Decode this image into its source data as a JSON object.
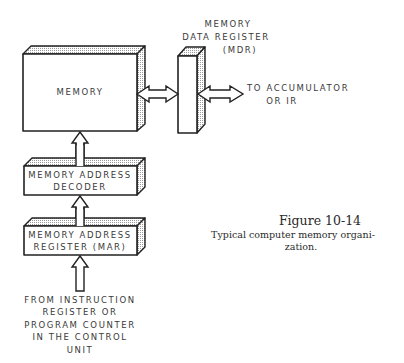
{
  "diagram": {
    "blocks": {
      "memory": {
        "label": "MEMORY"
      },
      "mdr": {
        "label_lines": [
          "MEMORY",
          "DATA REGISTER",
          "(MDR)"
        ]
      },
      "decoder": {
        "label_lines": [
          "MEMORY ADDRESS",
          "DECODER"
        ]
      },
      "mar": {
        "label_lines": [
          "MEMORY ADDRESS",
          "REGISTER (MAR)"
        ]
      }
    },
    "outputs": {
      "to_accumulator": {
        "label_lines": [
          "TO ACCUMULATOR",
          "OR IR"
        ]
      }
    },
    "inputs": {
      "from_control": {
        "label_lines": [
          "FROM INSTRUCTION",
          "REGISTER OR",
          "PROGRAM COUNTER",
          "IN THE CONTROL",
          "UNIT"
        ]
      }
    },
    "connections": [
      {
        "from": "memory",
        "to": "mdr",
        "type": "bidirectional"
      },
      {
        "from": "mdr",
        "to": "to_accumulator",
        "type": "bidirectional"
      },
      {
        "from": "decoder",
        "to": "memory",
        "type": "unidirectional"
      },
      {
        "from": "mar",
        "to": "decoder",
        "type": "unidirectional"
      },
      {
        "from": "from_control",
        "to": "mar",
        "type": "unidirectional"
      }
    ]
  },
  "caption": {
    "title": "Figure 10-14",
    "text_lines": [
      "Typical computer memory organi-",
      "zation."
    ]
  }
}
